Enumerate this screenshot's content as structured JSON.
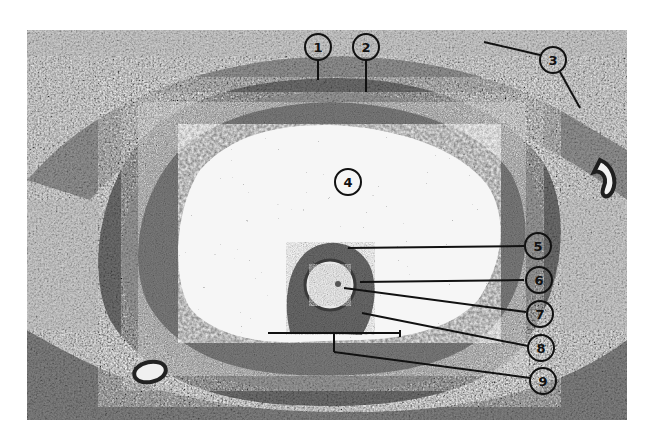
{
  "figure": {
    "labels": [
      {
        "id": "1",
        "text": "1"
      },
      {
        "id": "2",
        "text": "2"
      },
      {
        "id": "3",
        "text": "3"
      },
      {
        "id": "4",
        "text": "4"
      },
      {
        "id": "5",
        "text": "5"
      },
      {
        "id": "6",
        "text": "6"
      },
      {
        "id": "7",
        "text": "7"
      },
      {
        "id": "8",
        "text": "8"
      },
      {
        "id": "9",
        "text": "9"
      }
    ],
    "colors": {
      "background": "#ffffff",
      "tissue_light": "#d9d9d9",
      "tissue_dark": "#4a4a4a",
      "antrum": "#f4f4f4",
      "ink": "#111111"
    }
  }
}
